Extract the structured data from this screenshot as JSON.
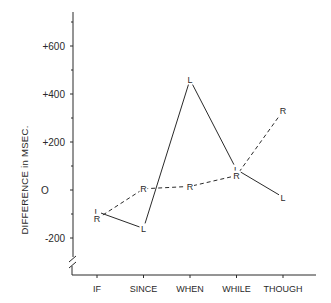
{
  "chart_data": {
    "type": "line",
    "title": "",
    "xlabel": "",
    "ylabel": "DIFFERENCE in MSEC.",
    "categories": [
      "IF",
      "SINCE",
      "WHEN",
      "WHILE",
      "THOUGH"
    ],
    "series": [
      {
        "name": "L",
        "marker": "L",
        "style": "solid",
        "values": [
          -90,
          -160,
          460,
          85,
          -30
        ]
      },
      {
        "name": "R",
        "marker": "R",
        "style": "dashed",
        "values": [
          -120,
          5,
          15,
          60,
          330
        ]
      }
    ],
    "yticks": [
      {
        "value": 600,
        "label": "+600"
      },
      {
        "value": 400,
        "label": "+400"
      },
      {
        "value": 200,
        "label": "+200"
      },
      {
        "value": 0,
        "label": "O"
      },
      {
        "value": -200,
        "label": "-200"
      }
    ],
    "minor_yticks": [
      700,
      500,
      300,
      100,
      -100
    ],
    "ylim": [
      -300,
      750
    ],
    "axis_break": true,
    "grid": false,
    "legend": "none (series identified by L / R point markers)"
  },
  "colors": {
    "ink": "#2a2a2a",
    "background": "#ffffff"
  }
}
